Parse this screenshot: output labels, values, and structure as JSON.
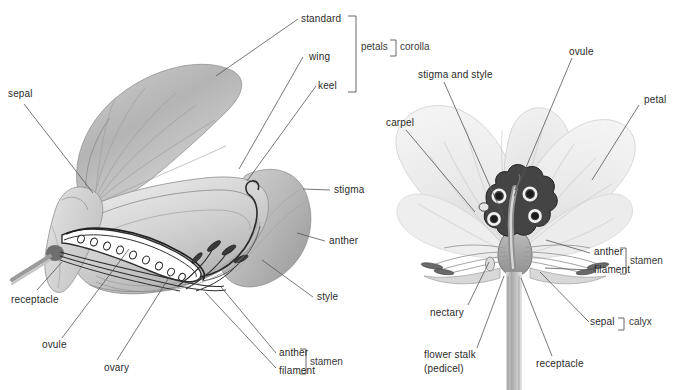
{
  "figure": {
    "background_color": "#ffffff",
    "label_color": "#2b2b2b",
    "leader_line_color": "#555555",
    "panels": [
      {
        "name": "pea-flower-cutaway",
        "description": "Sweet pea / pea flower shown in longitudinal section"
      },
      {
        "name": "buttercup-flower-cutaway",
        "description": "Buttercup flower shown in longitudinal section"
      }
    ]
  },
  "left_panel": {
    "labels": {
      "standard": "standard",
      "wing": "wing",
      "keel": "keel",
      "sepal": "sepal",
      "stigma": "stigma",
      "anther_upper": "anther",
      "style": "style",
      "receptacle": "receptacle",
      "ovule": "ovule",
      "ovary": "ovary",
      "anther_lower": "anther",
      "filament": "filament"
    },
    "brackets": {
      "petals": "petals",
      "corolla": "corolla",
      "stamen": "stamen"
    }
  },
  "right_panel": {
    "labels": {
      "carpel": "carpel",
      "stigma_and_style": "stigma and style",
      "ovule": "ovule",
      "petal": "petal",
      "anther": "anther",
      "filament": "filament",
      "nectary": "nectary",
      "flower_stalk_line1": "flower stalk",
      "flower_stalk_line2": "(pedicel)",
      "receptacle": "receptacle",
      "sepal": "sepal"
    },
    "brackets": {
      "stamen": "stamen",
      "calyx": "calyx"
    }
  },
  "colors": {
    "petal_light": "#e9e9e9",
    "petal_mid": "#cfcfcf",
    "petal_dark": "#a8a8a8",
    "carpel_dark": "#3d3d3d",
    "stem_gray": "#bcbcbc",
    "line": "#555555"
  }
}
